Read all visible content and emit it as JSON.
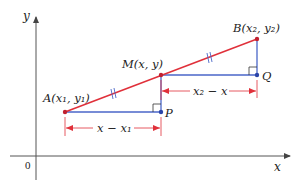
{
  "diagram": {
    "type": "geometry-midpoint",
    "axes": {
      "x_label": "x",
      "y_label": "y",
      "origin_label": "0"
    },
    "points": {
      "A": {
        "label": "A(x₁, y₁)"
      },
      "B": {
        "label": "B(x₂, y₂)"
      },
      "M": {
        "label": "M(x, y)"
      },
      "P": {
        "label": "P"
      },
      "Q": {
        "label": "Q"
      }
    },
    "dimensions": {
      "lower": "x − x₁",
      "upper": "x₂ − x"
    },
    "colors": {
      "segment": "#e0303a",
      "legs": "#4a66c8",
      "dimension": "#e0303a",
      "axes": "#555555",
      "tick_marks": "#4a66c8"
    }
  }
}
